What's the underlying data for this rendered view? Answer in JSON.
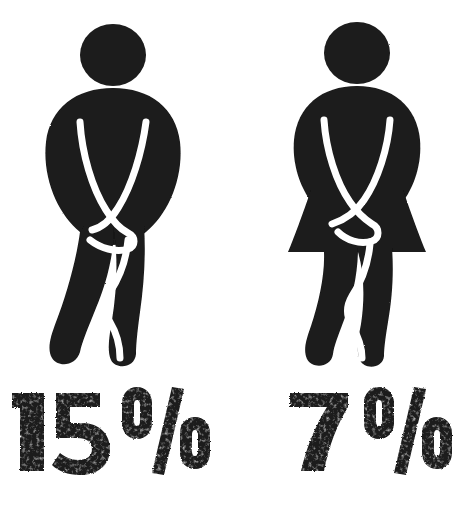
{
  "poster": {
    "background_color": "#ffffff",
    "ink_color": "#1a1a1a",
    "highlight_color": "#ffffff",
    "width": 465,
    "height": 514
  },
  "figures": [
    {
      "id": "male",
      "icon_name": "male-restroom-pictogram-crossed-legs",
      "label": "Man pictogram with crossed legs and clasped hands",
      "color": "#1a1a1a"
    },
    {
      "id": "female",
      "icon_name": "female-restroom-pictogram-crossed-legs",
      "label": "Woman pictogram in skirt with crossed legs and clasped hands",
      "color": "#1a1a1a"
    }
  ],
  "captions": [
    {
      "id": "male-stat",
      "value": "15",
      "unit": "%",
      "full_text": "15%",
      "color": "#1a1a1a"
    },
    {
      "id": "female-stat",
      "value": "7",
      "unit": "%",
      "full_text": "7%",
      "color": "#1a1a1a"
    }
  ]
}
